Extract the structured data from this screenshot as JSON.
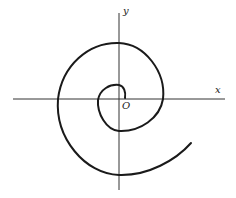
{
  "diagram": {
    "type": "spiral-on-cartesian-axes",
    "labels": {
      "x_axis": "x",
      "y_axis": "y",
      "origin": "O"
    },
    "colors": {
      "stroke": "#1a1a1a",
      "axis": "#333333",
      "background": "#ffffff"
    },
    "elements": [
      "horizontal x-axis",
      "vertical y-axis",
      "spiral curve winding outward from origin, ending lower-right"
    ]
  }
}
